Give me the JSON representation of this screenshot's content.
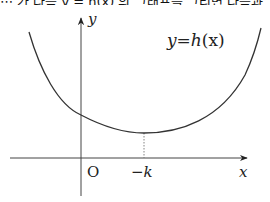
{
  "top_strip": {
    "text": "⋯ 가 다음 y = h(x) 의 그래프를 그리면 다음과"
  },
  "graph": {
    "function_label": "y = h(x)",
    "function_label_parts": {
      "lhs": "y",
      "eq": "=",
      "fn": "h",
      "arg": "(x)"
    },
    "axes": {
      "x_label": "x",
      "y_label": "y",
      "origin_label": "O"
    },
    "min_point_label": "−k",
    "colors": {
      "stroke": "#333333",
      "dashed": "#777777"
    }
  }
}
